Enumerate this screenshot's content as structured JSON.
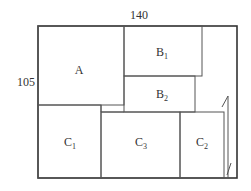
{
  "diagram": {
    "dimensions": {
      "width_label": "140",
      "height_label": "105"
    },
    "pieces": [
      {
        "id": "A",
        "label": "A",
        "subscript": ""
      },
      {
        "id": "B1",
        "label": "B",
        "subscript": "1"
      },
      {
        "id": "B2",
        "label": "B",
        "subscript": "2"
      },
      {
        "id": "C1",
        "label": "C",
        "subscript": "1"
      },
      {
        "id": "C3",
        "label": "C",
        "subscript": "3"
      },
      {
        "id": "C2",
        "label": "C",
        "subscript": "2"
      }
    ],
    "colors": {
      "outline": "#333333",
      "inner_line": "#555555",
      "background": "#ffffff"
    }
  }
}
